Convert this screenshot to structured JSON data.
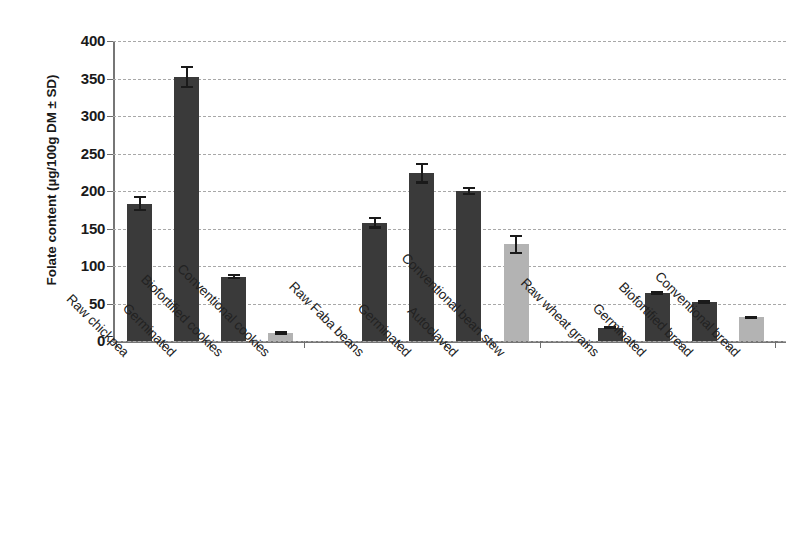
{
  "chart_data": {
    "type": "bar",
    "title": "",
    "xlabel": "",
    "ylabel": "Folate content (µg/100g DM ± SD)",
    "ylim": [
      0,
      400
    ],
    "ytick_values": [
      0,
      50,
      100,
      150,
      200,
      250,
      300,
      350,
      400
    ],
    "ytick_labels": [
      "0",
      "50",
      "100",
      "150",
      "200",
      "250",
      "300",
      "350",
      "400"
    ],
    "grid": true,
    "legend": "none",
    "error_bars": "SD",
    "colors": {
      "dark_bar": "#3a3a3a",
      "light_bar": "#b3b3b3",
      "gridline": "#a8a8a8",
      "axis": "#767676",
      "text": "#1a1a1a"
    },
    "groups": [
      {
        "name": "Chickpea",
        "categories": [
          "Raw chickpea",
          "Germinated",
          "Biofortified cookies",
          "Conventional cookies"
        ],
        "values": [
          183,
          352,
          86,
          11
        ],
        "errors": [
          10,
          15,
          3,
          3
        ],
        "shades": [
          "dark",
          "dark",
          "dark",
          "light"
        ]
      },
      {
        "name": "Faba bean",
        "categories": [
          "Raw Faba beans",
          "Germinated",
          "Autoclaved",
          "Conventional bean stew"
        ],
        "values": [
          158,
          224,
          200,
          129
        ],
        "errors": [
          8,
          14,
          5,
          13
        ],
        "shades": [
          "dark",
          "dark",
          "dark",
          "light"
        ]
      },
      {
        "name": "Wheat",
        "categories": [
          "Raw wheat grains",
          "Germinated",
          "Biofortified bread",
          "Conventional bread"
        ],
        "values": [
          18,
          64,
          52,
          32
        ],
        "errors": [
          2,
          3,
          3,
          2
        ],
        "shades": [
          "dark",
          "dark",
          "dark",
          "light"
        ]
      }
    ],
    "categories": [
      "Raw chickpea",
      "Germinated",
      "Biofortified cookies",
      "Conventional cookies",
      "Raw Faba beans",
      "Germinated",
      "Autoclaved",
      "Conventional bean stew",
      "Raw wheat grains",
      "Germinated",
      "Biofortified bread",
      "Conventional bread"
    ],
    "values": [
      183,
      352,
      86,
      11,
      158,
      224,
      200,
      129,
      18,
      64,
      52,
      32
    ],
    "errors": [
      10,
      15,
      3,
      3,
      8,
      14,
      5,
      13,
      2,
      3,
      3,
      2
    ]
  }
}
